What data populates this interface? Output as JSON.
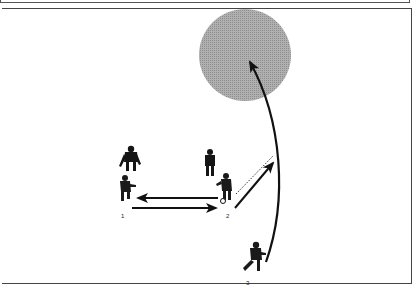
{
  "diagram": {
    "title": "",
    "type": "soccer-drill",
    "field": {
      "border_color": "#444444",
      "background": "#ffffff"
    },
    "target_zone": {
      "shape": "circle",
      "color": "#a6a6a6",
      "cx": 245,
      "cy": 55,
      "r": 46
    },
    "players": [
      {
        "id": "defender-a",
        "label": "",
        "x": 128,
        "y": 160,
        "role": "opponent"
      },
      {
        "id": "defender-b",
        "label": "",
        "x": 210,
        "y": 162,
        "role": "opponent"
      },
      {
        "id": "player-1",
        "label": "1",
        "x": 124,
        "y": 190
      },
      {
        "id": "player-2",
        "label": "2",
        "x": 225,
        "y": 190,
        "has_ball": true
      },
      {
        "id": "player-3",
        "label": "3",
        "x": 252,
        "y": 258
      }
    ],
    "arrows": [
      {
        "id": "pass-2-to-1",
        "from": "player-2",
        "to": "player-1",
        "style": "solid"
      },
      {
        "id": "pass-1-to-2",
        "from": "player-1",
        "to": "player-2",
        "style": "solid"
      },
      {
        "id": "dribble-2",
        "from": "player-2",
        "to": "up-right",
        "style": "solid"
      },
      {
        "id": "run-2",
        "style": "dotted"
      },
      {
        "id": "run-3-to-zone",
        "from": "player-3",
        "to": "target_zone",
        "style": "curved-solid"
      }
    ],
    "labels": {
      "p1": "1",
      "p2": "2",
      "p3": "3"
    }
  }
}
